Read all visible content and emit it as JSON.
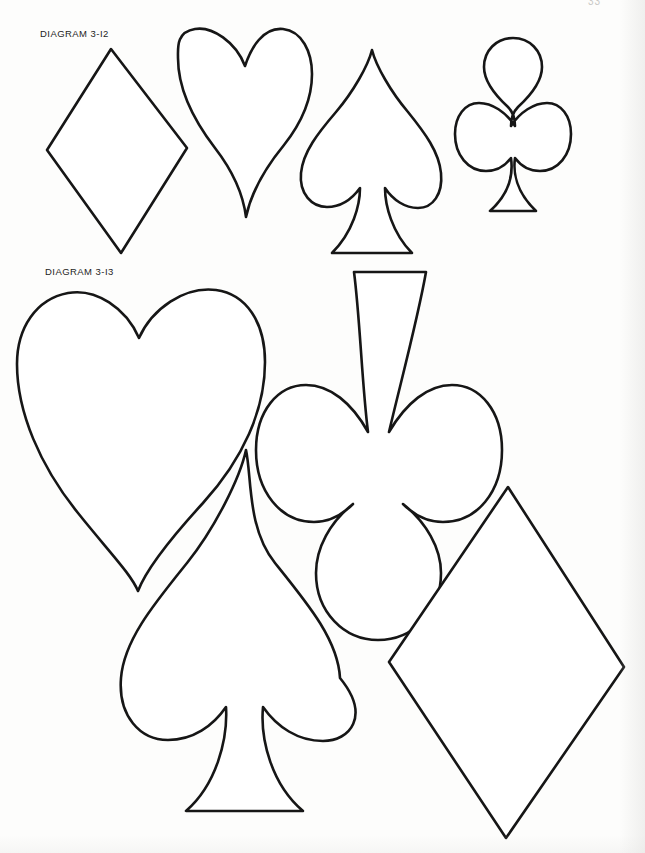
{
  "page": {
    "background_color": "#fdfdfc",
    "ink_color": "#161616",
    "page_number": "33",
    "width": 645,
    "height": 853
  },
  "labels": {
    "diagram_1": "DIAGRAM 3-I2",
    "diagram_2": "DIAGRAM 3-I3"
  },
  "diagram_1": {
    "caption": "DIAGRAM 3-I2",
    "shapes": [
      {
        "name": "diamond",
        "suit": "diamond",
        "size": "small",
        "orientation": "upright",
        "bounds": {
          "x": 46,
          "y": 47,
          "width": 142,
          "height": 208
        }
      },
      {
        "name": "heart",
        "suit": "heart",
        "size": "small",
        "orientation": "upright",
        "bounds": {
          "x": 177,
          "y": 27,
          "width": 136,
          "height": 192
        }
      },
      {
        "name": "spade",
        "suit": "spade",
        "size": "small",
        "orientation": "upright",
        "bounds": {
          "x": 299,
          "y": 48,
          "width": 142,
          "height": 207
        }
      },
      {
        "name": "club",
        "suit": "club",
        "size": "small",
        "orientation": "upright",
        "bounds": {
          "x": 454,
          "y": 37,
          "width": 118,
          "height": 176
        }
      }
    ]
  },
  "diagram_2": {
    "caption": "DIAGRAM 3-I3",
    "shapes": [
      {
        "name": "heart",
        "suit": "heart",
        "size": "large",
        "orientation": "upright",
        "bounds": {
          "x": 16,
          "y": 289,
          "width": 250,
          "height": 303
        }
      },
      {
        "name": "club",
        "suit": "club",
        "size": "large",
        "orientation": "inverted",
        "bounds": {
          "x": 266,
          "y": 271,
          "width": 236,
          "height": 326
        }
      },
      {
        "name": "spade",
        "suit": "spade",
        "size": "large",
        "orientation": "upright",
        "bounds": {
          "x": 120,
          "y": 449,
          "width": 222,
          "height": 363
        }
      },
      {
        "name": "diamond",
        "suit": "diamond",
        "size": "large",
        "orientation": "upright",
        "bounds": {
          "x": 388,
          "y": 486,
          "width": 237,
          "height": 353
        }
      }
    ]
  }
}
